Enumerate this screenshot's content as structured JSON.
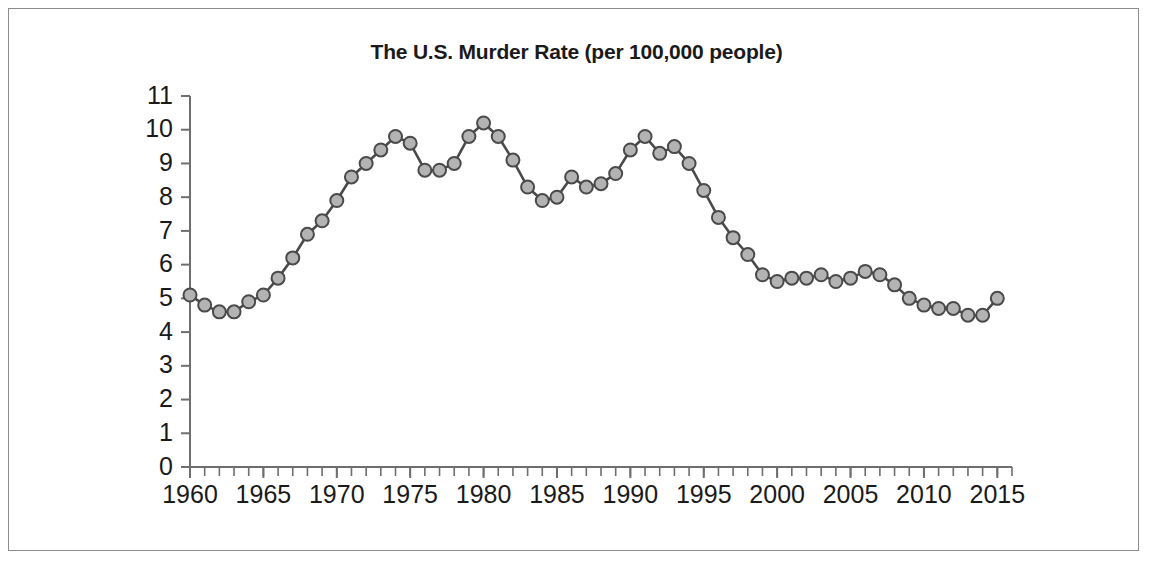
{
  "figure": {
    "border_color": "#8c8c8c",
    "background": "#ffffff"
  },
  "chart_data": {
    "type": "line",
    "title": "The U.S. Murder Rate (per 100,000 people)",
    "xlabel": "",
    "ylabel": "",
    "xlim": [
      1960,
      2016
    ],
    "ylim": [
      0,
      11
    ],
    "grid": false,
    "legend": false,
    "line_color": "#4a4a4a",
    "marker_fill": "#b3b3b3",
    "marker_edge": "#4a4a4a",
    "y_ticks": [
      0,
      1,
      2,
      3,
      4,
      5,
      6,
      7,
      8,
      9,
      10,
      11
    ],
    "y_tick_labels": [
      "0",
      "1",
      "2",
      "3",
      "4",
      "5",
      "6",
      "7",
      "8",
      "9",
      "10",
      "11"
    ],
    "x_ticks": [
      1960,
      1965,
      1970,
      1975,
      1980,
      1985,
      1990,
      1995,
      2000,
      2005,
      2010,
      2015
    ],
    "x_tick_labels": [
      "1960",
      "1965",
      "1970",
      "1975",
      "1980",
      "1985",
      "1990",
      "1995",
      "2000",
      "2005",
      "2010",
      "2015"
    ],
    "x_minor_tick_interval": 1,
    "x": [
      1960,
      1961,
      1962,
      1963,
      1964,
      1965,
      1966,
      1967,
      1968,
      1969,
      1970,
      1971,
      1972,
      1973,
      1974,
      1975,
      1976,
      1977,
      1978,
      1979,
      1980,
      1981,
      1982,
      1983,
      1984,
      1985,
      1986,
      1987,
      1988,
      1989,
      1990,
      1991,
      1992,
      1993,
      1994,
      1995,
      1996,
      1997,
      1998,
      1999,
      2000,
      2001,
      2002,
      2003,
      2004,
      2005,
      2006,
      2007,
      2008,
      2009,
      2010,
      2011,
      2012,
      2013,
      2014,
      2015
    ],
    "values": [
      5.1,
      4.8,
      4.6,
      4.6,
      4.9,
      5.1,
      5.6,
      6.2,
      6.9,
      7.3,
      7.9,
      8.6,
      9.0,
      9.4,
      9.8,
      9.6,
      8.8,
      8.8,
      9.0,
      9.8,
      10.2,
      9.8,
      9.1,
      8.3,
      7.9,
      8.0,
      8.6,
      8.3,
      8.4,
      8.7,
      9.4,
      9.8,
      9.3,
      9.5,
      9.0,
      8.2,
      7.4,
      6.8,
      6.3,
      5.7,
      5.5,
      5.6,
      5.6,
      5.7,
      5.5,
      5.6,
      5.8,
      5.7,
      5.4,
      5.0,
      4.8,
      4.7,
      4.7,
      4.5,
      4.5,
      5.0
    ],
    "series": [
      {
        "name": "U.S. murder rate per 100,000 people",
        "values": [
          5.1,
          4.8,
          4.6,
          4.6,
          4.9,
          5.1,
          5.6,
          6.2,
          6.9,
          7.3,
          7.9,
          8.6,
          9.0,
          9.4,
          9.8,
          9.6,
          8.8,
          8.8,
          9.0,
          9.8,
          10.2,
          9.8,
          9.1,
          8.3,
          7.9,
          8.0,
          8.6,
          8.3,
          8.4,
          8.7,
          9.4,
          9.8,
          9.3,
          9.5,
          9.0,
          8.2,
          7.4,
          6.8,
          6.3,
          5.7,
          5.5,
          5.6,
          5.6,
          5.7,
          5.5,
          5.6,
          5.8,
          5.7,
          5.4,
          5.0,
          4.8,
          4.7,
          4.7,
          4.5,
          4.5,
          5.0
        ]
      }
    ]
  }
}
